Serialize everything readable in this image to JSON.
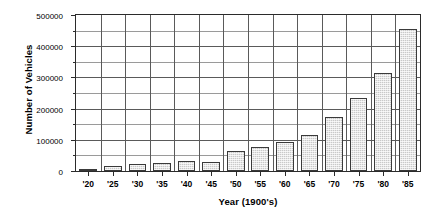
{
  "chart_data": {
    "type": "bar",
    "title": "",
    "xlabel": "Year (1900's)",
    "ylabel": "Number of Vehicles",
    "categories": [
      "'20",
      "'25",
      "'30",
      "'35",
      "'40",
      "'45",
      "'50",
      "'55",
      "'60",
      "'65",
      "'70",
      "'75",
      "'80",
      "'85"
    ],
    "values": [
      5000,
      15000,
      22000,
      25000,
      33000,
      30000,
      63000,
      76000,
      92000,
      117000,
      174000,
      234000,
      313000,
      454000
    ],
    "ylim": [
      0,
      500000
    ],
    "ytick_values": [
      0,
      100000,
      200000,
      300000,
      400000,
      500000
    ],
    "ytick_labels": [
      "0",
      "100000",
      "200000",
      "300000",
      "400000",
      "500000"
    ],
    "yminor_values": [
      50000,
      150000,
      250000,
      350000,
      450000
    ],
    "grid": "both",
    "legend": "none",
    "bar_fill": "#c9c9c9",
    "bar_edge": "#3a3a3a",
    "axis_color": "#2b2b2b",
    "grid_color": "#5a5a5a"
  }
}
